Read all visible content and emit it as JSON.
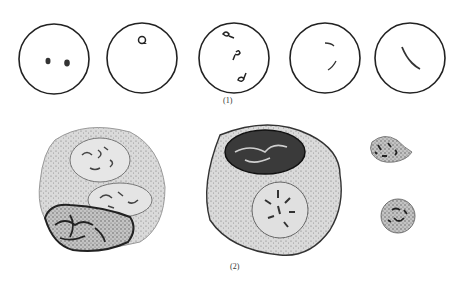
{
  "figure": {
    "panel1": {
      "label": "(1)",
      "cells": [
        {
          "stage": "ring-pair",
          "description": "two small dots"
        },
        {
          "stage": "single-ring",
          "description": "one ring-form"
        },
        {
          "stage": "three-forms",
          "description": "three comma forms"
        },
        {
          "stage": "thin-curves",
          "description": "two thin curved forms"
        },
        {
          "stage": "elongated",
          "description": "single elongated form"
        }
      ]
    },
    "panel2": {
      "label": "(2)",
      "cells": [
        {
          "stage": "large-multinucleate",
          "description": "large cell with three nuclei"
        },
        {
          "stage": "large-binucleate",
          "description": "large cell with two nuclei"
        },
        {
          "stage": "small-upper",
          "description": "small cell"
        },
        {
          "stage": "small-lower",
          "description": "small round cell"
        }
      ]
    },
    "colors": {
      "outline": "#222222",
      "cytoplasm": "#d8d8d8",
      "nucleus_dark": "#333333",
      "background": "#ffffff"
    }
  }
}
